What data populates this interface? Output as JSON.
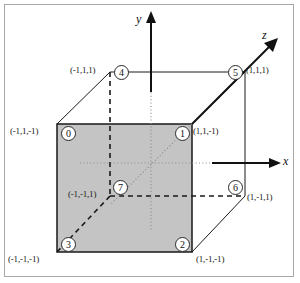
{
  "figure": {
    "background": "#ffffff",
    "face_fill": "#c4c4c4",
    "line_color": "#1a1a1a",
    "frame_color": "#a8a8a8"
  },
  "axes": [
    {
      "name": "x",
      "label": "x"
    },
    {
      "name": "y",
      "label": "y"
    },
    {
      "name": "z",
      "label": "z"
    }
  ],
  "vertices": [
    {
      "id": "0",
      "number": "0",
      "coords": "(-1,1,-1)"
    },
    {
      "id": "1",
      "number": "1",
      "coords": "(1,1,-1)"
    },
    {
      "id": "2",
      "number": "2",
      "coords": "(1,-1,-1)"
    },
    {
      "id": "3",
      "number": "3",
      "coords": "(-1,-1,-1)"
    },
    {
      "id": "4",
      "number": "4",
      "coords": "(-1,1,1)"
    },
    {
      "id": "5",
      "number": "5",
      "coords": "(1,1,1)"
    },
    {
      "id": "6",
      "number": "6",
      "coords": "(1,-1,1)"
    },
    {
      "id": "7",
      "number": "7",
      "coords": "(-1,-1,1)"
    }
  ]
}
